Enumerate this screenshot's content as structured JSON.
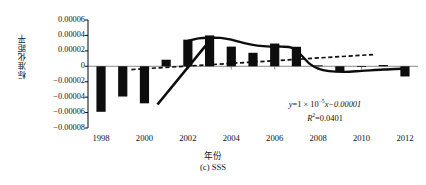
{
  "figure": {
    "caption": "(c) SSS",
    "axis_titles": {
      "y": "标准化距平",
      "x": "年份"
    },
    "annotations": {
      "equation_prefix": "y",
      "equation_body": "=1 × 10",
      "equation_exponent": "−5",
      "equation_suffix": "x−0.00001",
      "r2_symbol": "R",
      "r2_exponent": "2",
      "r2_value": "=0.0401"
    }
  },
  "chart_data": {
    "type": "bar",
    "title": "(c) SSS",
    "xlabel": "年份",
    "ylabel": "标准化距平",
    "grid": false,
    "legend": "none",
    "xlim": [
      1997.4,
      2012.6
    ],
    "ylim": [
      -8e-05,
      6e-05
    ],
    "ytick_labels": [
      "0.00006",
      "0.00004",
      "0.00002",
      "0",
      "−0.00002",
      "−0.00004",
      "−0.00006",
      "−0.00008"
    ],
    "ytick_values": [
      6e-05,
      4e-05,
      2e-05,
      0,
      -2e-05,
      -4e-05,
      -6e-05,
      -8e-05
    ],
    "xtick_labels": [
      "1998",
      "2000",
      "2002",
      "2004",
      "2006",
      "2008",
      "2010",
      "2012"
    ],
    "xtick_values": [
      1998,
      2000,
      2002,
      2004,
      2006,
      2008,
      2010,
      2012
    ],
    "categories": [
      1998,
      1999,
      2000,
      2001,
      2002,
      2003,
      2004,
      2005,
      2006,
      2007,
      2008,
      2009,
      2010,
      2011,
      2012
    ],
    "values": [
      -5.9e-05,
      -3.92e-05,
      -4.8e-05,
      8.5e-06,
      3.45e-05,
      4e-05,
      2.55e-05,
      1.75e-05,
      2.95e-05,
      2.53e-05,
      1.2e-06,
      -7e-06,
      4e-07,
      1.6e-06,
      -1.32e-05
    ],
    "series": [
      {
        "name": "标准化距平",
        "type": "bar",
        "values": [
          -5.9e-05,
          -3.92e-05,
          -4.8e-05,
          8.5e-06,
          3.45e-05,
          4e-05,
          2.55e-05,
          1.75e-05,
          2.95e-05,
          2.53e-05,
          1.2e-06,
          -7e-06,
          4e-07,
          1.6e-06,
          -1.32e-05
        ]
      },
      {
        "name": "平滑曲线",
        "type": "line",
        "style": "solid-thick",
        "x": [
          2002.0,
          2002.5,
          2003.0,
          2003.5,
          2004.0,
          2004.6,
          2005.2,
          2005.8,
          2006.3,
          2006.8,
          2007.2,
          2007.6,
          2008.0,
          2008.5,
          2009.2,
          2010.0,
          2011.0,
          2012.0
        ],
        "y": [
          3.3e-05,
          3.62e-05,
          3.7e-05,
          3.68e-05,
          3.45e-05,
          3e-05,
          2.68e-05,
          2.55e-05,
          2.55e-05,
          2.4e-05,
          1.5e-05,
          3.5e-06,
          -3e-06,
          -6.2e-06,
          -7.2e-06,
          -6e-06,
          -4.2e-06,
          -3e-06
        ]
      },
      {
        "name": "上升段",
        "type": "line",
        "style": "solid-thick-segment",
        "x": [
          2000.6,
          2003.0
        ],
        "y": [
          -4.95e-05,
          3.3e-05
        ]
      },
      {
        "name": "线性趋势",
        "type": "line",
        "style": "dashed",
        "x": [
          1999.4,
          2010.6
        ],
        "y": [
          -4.2e-06,
          1.53e-05
        ]
      }
    ]
  }
}
